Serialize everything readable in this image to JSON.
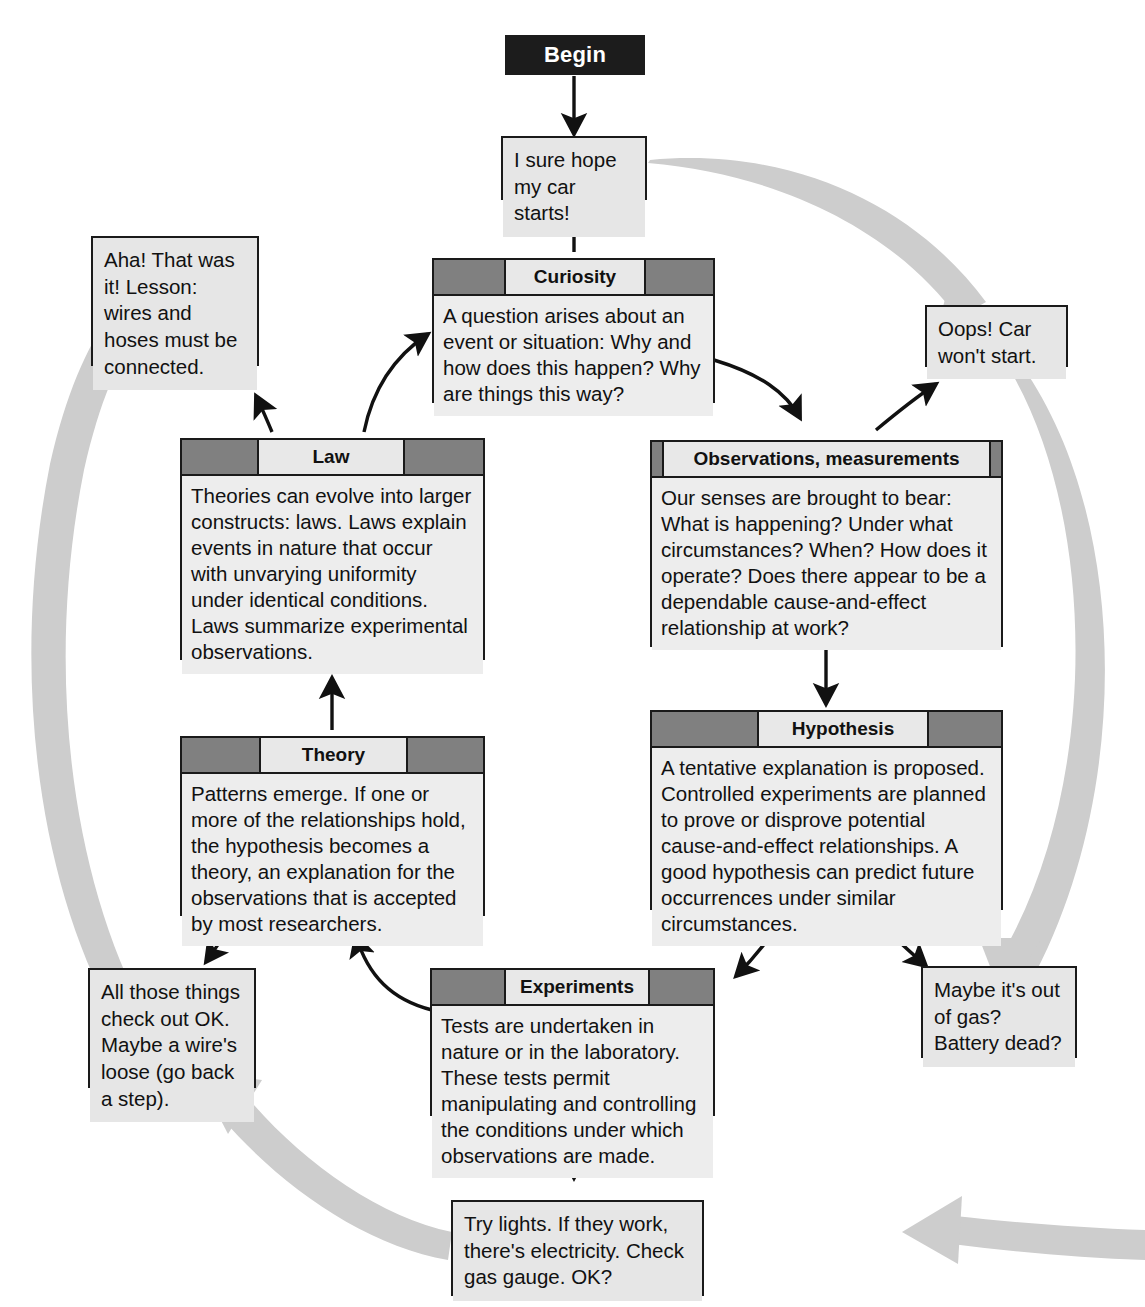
{
  "diagram": {
    "colors": {
      "header_gray": "#808080",
      "box_fill": "#e8e8e8",
      "begin_fill": "#1c1c1c",
      "arc_gray": "#cccccc",
      "outline": "#1a1a1a"
    }
  },
  "begin": {
    "label": "Begin"
  },
  "stages": [
    {
      "id": "curiosity",
      "title": "Curiosity",
      "body": "A question arises about an event or situation: Why and how does this happen? Why are things this way?"
    },
    {
      "id": "observations",
      "title": "Observations, measurements",
      "body": "Our senses are brought to bear: What is happening? Under what circumstances? When? How does it operate? Does there appear to be a dependable cause-and-effect relationship at work?"
    },
    {
      "id": "hypothesis",
      "title": "Hypothesis",
      "body": "A tentative explanation is proposed. Controlled experiments are planned to prove or disprove potential cause-and-effect relationships. A good hypothesis can predict future occurrences under similar circumstances."
    },
    {
      "id": "experiments",
      "title": "Experiments",
      "body": "Tests are undertaken in nature or in the laboratory. These tests permit manipulating and controlling the conditions under which observations are made."
    },
    {
      "id": "theory",
      "title": "Theory",
      "body": "Patterns emerge. If one or more of the relationships hold, the hypothesis becomes a theory, an explanation for the observations that is accepted by most researchers."
    },
    {
      "id": "law",
      "title": "Law",
      "body": "Theories can evolve into larger constructs: laws. Laws explain events in nature that occur with unvarying uniformity under identical conditions. Laws summarize experimental observations."
    }
  ],
  "examples": [
    {
      "id": "car-starts",
      "text": "I sure hope my car starts!"
    },
    {
      "id": "car-wont-start",
      "text": "Oops! Car won't start."
    },
    {
      "id": "out-of-gas",
      "text": "Maybe it's out of gas? Battery dead?"
    },
    {
      "id": "try-lights",
      "text": "Try lights. If they work, there's electricity. Check gas gauge. OK?"
    },
    {
      "id": "check-out-ok",
      "text": "All those things check out OK. Maybe a wire's loose (go back a step)."
    },
    {
      "id": "aha-lesson",
      "text": "Aha! That was it! Lesson: wires and hoses must be connected."
    }
  ]
}
